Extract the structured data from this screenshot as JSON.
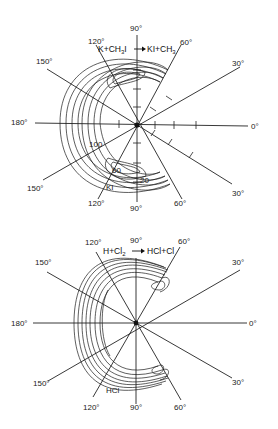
{
  "diagrams": [
    {
      "id": "top",
      "reaction": "K+CH₃I → KI+CH₃",
      "reaction_left": "K+CH",
      "reaction_sub1": "3",
      "reaction_mid": "I",
      "reaction_right": "KI+CH",
      "reaction_sub2": "3",
      "product_label": "KI",
      "contour_labels": [
        "20",
        "60",
        "100"
      ],
      "angle_labels": {
        "top_90": "90°",
        "top_120": "120°",
        "top_60": "60°",
        "top_150": "150°",
        "top_30": "30°",
        "left_180": "180°",
        "right_0": "0°",
        "bot_150": "150°",
        "bot_30": "30°",
        "bot_120": "120°",
        "bot_90": "90°",
        "bot_60": "60°"
      }
    },
    {
      "id": "bottom",
      "reaction": "H+Cl₂ → HCl+Cl",
      "reaction_left": "H+Cl",
      "reaction_sub1": "2",
      "reaction_right": "HCl+Cl",
      "product_label": "HCl",
      "angle_labels": {
        "top_90": "90°",
        "top_120": "120°",
        "top_60": "60°",
        "top_150": "150°",
        "top_30": "30°",
        "left_180": "180°",
        "right_0": "0°",
        "bot_150": "150°",
        "bot_30": "30°",
        "bot_120": "120°",
        "bot_90": "90°",
        "bot_60": "60°"
      }
    }
  ]
}
